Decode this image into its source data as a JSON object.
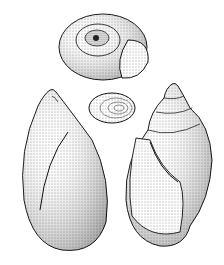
{
  "illustration": {
    "subject": "snail shell drawings",
    "background": "#ffffff",
    "ink": "#1a1a1a",
    "figures": [
      {
        "name": "shell-top-view"
      },
      {
        "name": "operculum"
      },
      {
        "name": "shell-apertural-view-left"
      },
      {
        "name": "shell-apertural-view-right"
      }
    ]
  }
}
